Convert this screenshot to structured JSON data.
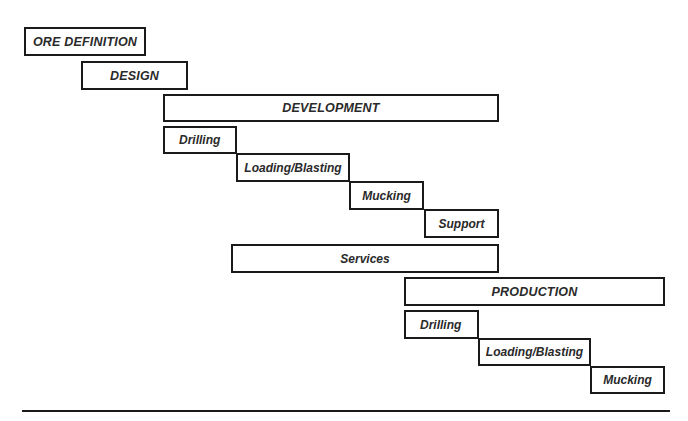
{
  "diagram": {
    "type": "staggered-phase-timeline",
    "phases": [
      {
        "label": "ORE DEFINITION",
        "level": "phase",
        "box": {
          "x": 24,
          "y": 27,
          "w": 122,
          "h": 29
        }
      },
      {
        "label": "DESIGN",
        "level": "phase",
        "box": {
          "x": 81,
          "y": 61,
          "w": 107,
          "h": 29
        }
      },
      {
        "label": "DEVELOPMENT",
        "level": "phase",
        "box": {
          "x": 163,
          "y": 94,
          "w": 336,
          "h": 28
        },
        "children": [
          {
            "label": "Drilling",
            "box": {
              "x": 163,
              "y": 126,
              "w": 74,
              "h": 28
            }
          },
          {
            "label": "Loading/Blasting",
            "box": {
              "x": 236,
              "y": 153,
              "w": 114,
              "h": 29
            }
          },
          {
            "label": "Mucking",
            "box": {
              "x": 349,
              "y": 181,
              "w": 75,
              "h": 29
            }
          },
          {
            "label": "Support",
            "box": {
              "x": 424,
              "y": 209,
              "w": 75,
              "h": 29
            }
          }
        ]
      },
      {
        "label": "Services",
        "level": "sub",
        "box": {
          "x": 231,
          "y": 244,
          "w": 268,
          "h": 29
        }
      },
      {
        "label": "PRODUCTION",
        "level": "phase",
        "box": {
          "x": 404,
          "y": 277,
          "w": 261,
          "h": 29
        },
        "children": [
          {
            "label": "Drilling",
            "box": {
              "x": 404,
              "y": 310,
              "w": 75,
              "h": 29
            }
          },
          {
            "label": "Loading/Blasting",
            "box": {
              "x": 478,
              "y": 338,
              "w": 113,
              "h": 28
            }
          },
          {
            "label": "Mucking",
            "box": {
              "x": 590,
              "y": 366,
              "w": 75,
              "h": 28
            }
          }
        ]
      }
    ],
    "baseline": {
      "x1": 22,
      "x2": 670,
      "y": 411
    },
    "colors": {
      "stroke": "#1a1a1a",
      "text": "#2a2a2a",
      "fill": "#ffffff"
    }
  }
}
